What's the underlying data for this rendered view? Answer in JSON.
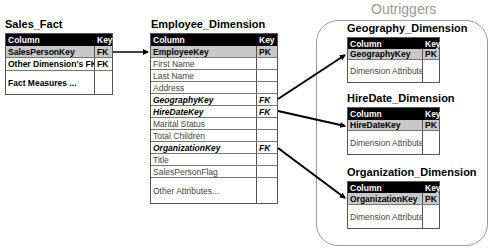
{
  "group": {
    "title": "Outriggers"
  },
  "tables": {
    "sales_fact": {
      "title": "Sales_Fact",
      "header": {
        "column": "Column",
        "key": "Key"
      },
      "rows": [
        {
          "column": "SalesPersonKey",
          "key": "FK"
        },
        {
          "column": "Other Dimension's FKs",
          "key": "FK"
        },
        {
          "column": "Fact Measures ...",
          "key": ""
        }
      ]
    },
    "employee_dimension": {
      "title": "Employee_Dimension",
      "header": {
        "column": "Column",
        "key": "Key"
      },
      "rows": [
        {
          "column": "EmployeeKey",
          "key": "PK"
        },
        {
          "column": "First Name",
          "key": ""
        },
        {
          "column": "Last Name",
          "key": ""
        },
        {
          "column": "Address",
          "key": ""
        },
        {
          "column": "GeographyKey",
          "key": "FK"
        },
        {
          "column": "HireDateKey",
          "key": "FK"
        },
        {
          "column": "Marital Status",
          "key": ""
        },
        {
          "column": "Total Children",
          "key": ""
        },
        {
          "column": "OrganizationKey",
          "key": "FK"
        },
        {
          "column": "Title",
          "key": ""
        },
        {
          "column": "SalesPersonFlag",
          "key": ""
        },
        {
          "column": "Other Attributes...",
          "key": ""
        }
      ]
    },
    "geography_dimension": {
      "title": "Geography_Dimension",
      "header": {
        "column": "Column",
        "key": "Key"
      },
      "rows": [
        {
          "column": "GeographyKey",
          "key": "PK"
        },
        {
          "column": "Dimension Attributes...",
          "key": ""
        }
      ]
    },
    "hiredate_dimension": {
      "title": "HireDate_Dimension",
      "header": {
        "column": "Column",
        "key": "Key"
      },
      "rows": [
        {
          "column": "HireDateKey",
          "key": "PK"
        },
        {
          "column": "Dimension Attributes...",
          "key": ""
        }
      ]
    },
    "organization_dimension": {
      "title": "Organization_Dimension",
      "header": {
        "column": "Column",
        "key": "Key"
      },
      "rows": [
        {
          "column": "OrganizationKey",
          "key": "PK"
        },
        {
          "column": "Dimension Attributes...",
          "key": ""
        }
      ]
    }
  },
  "relationships": [
    {
      "from": "Sales_Fact.SalesPersonKey",
      "to": "Employee_Dimension.EmployeeKey"
    },
    {
      "from": "Employee_Dimension.GeographyKey",
      "to": "Geography_Dimension.GeographyKey"
    },
    {
      "from": "Employee_Dimension.HireDateKey",
      "to": "HireDate_Dimension.HireDateKey"
    },
    {
      "from": "Employee_Dimension.OrganizationKey",
      "to": "Organization_Dimension.OrganizationKey"
    }
  ]
}
